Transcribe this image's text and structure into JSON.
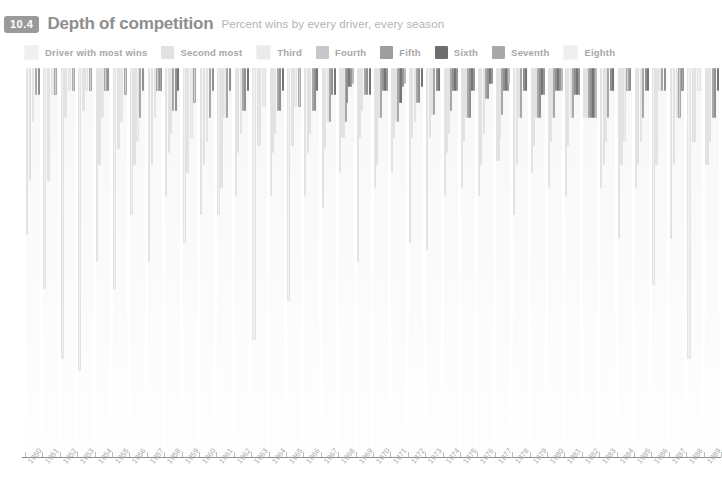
{
  "header": {
    "badge": "10.4",
    "title": "Depth of competition",
    "subtitle": "Percent wins by every driver, every season"
  },
  "legend": {
    "items": [
      {
        "label": "Driver with most wins",
        "color": "#f0f0f0"
      },
      {
        "label": "Second most",
        "color": "#e2e2e2"
      },
      {
        "label": "Third",
        "color": "#eaeaea"
      },
      {
        "label": "Fourth",
        "color": "#c8c8c8"
      },
      {
        "label": "Fifth",
        "color": "#9e9e9e"
      },
      {
        "label": "Sixth",
        "color": "#6e6e6e"
      },
      {
        "label": "Seventh",
        "color": "#a8a8a8"
      },
      {
        "label": "Eighth",
        "color": "#efefef"
      }
    ]
  },
  "chart_data": {
    "type": "bar",
    "title": "Depth of competition",
    "subtitle": "Percent wins by every driver, every season",
    "xlabel": "",
    "ylabel": "Percent wins",
    "ylim": [
      0,
      100
    ],
    "grid": false,
    "legend_position": "top",
    "orientation": "vertical",
    "note": "Each season column holds up to 8 nested bars, one per driver ranked by wins; bar length = that driver's percent of the season's wins.",
    "categories": [
      "1950",
      "1951",
      "1952",
      "1953",
      "1954",
      "1955",
      "1956",
      "1957",
      "1958",
      "1959",
      "1960",
      "1961",
      "1962",
      "1963",
      "1964",
      "1965",
      "1966",
      "1967",
      "1968",
      "1969",
      "1970",
      "1971",
      "1972",
      "1973",
      "1974",
      "1975",
      "1976",
      "1977",
      "1978",
      "1979",
      "1980",
      "1981",
      "1982",
      "1983",
      "1984",
      "1985",
      "1986",
      "1987",
      "1988",
      "1989"
    ],
    "series": [
      {
        "name": "Driver with most wins",
        "color": "#f0f0f0",
        "values": [
          43,
          57,
          75,
          78,
          50,
          57,
          38,
          50,
          33,
          45,
          38,
          38,
          33,
          70,
          33,
          60,
          33,
          36,
          27,
          50,
          31,
          27,
          45,
          47,
          33,
          31,
          33,
          24,
          38,
          27,
          31,
          33,
          13,
          31,
          44,
          31,
          56,
          44,
          75,
          25
        ]
      },
      {
        "name": "Second most",
        "color": "#e4e4e4",
        "values": [
          29,
          29,
          13,
          11,
          25,
          21,
          25,
          25,
          22,
          27,
          25,
          31,
          22,
          20,
          22,
          20,
          22,
          21,
          18,
          18,
          25,
          18,
          18,
          18,
          22,
          19,
          25,
          24,
          25,
          20,
          19,
          20,
          13,
          25,
          25,
          25,
          25,
          25,
          19,
          25
        ]
      },
      {
        "name": "Third",
        "color": "#ededed",
        "values": [
          14,
          7,
          6,
          6,
          13,
          14,
          19,
          13,
          17,
          18,
          19,
          13,
          17,
          10,
          17,
          10,
          17,
          14,
          18,
          11,
          13,
          14,
          14,
          12,
          17,
          13,
          17,
          18,
          13,
          13,
          13,
          13,
          13,
          19,
          19,
          19,
          6,
          13,
          6,
          19
        ]
      },
      {
        "name": "Fourth",
        "color": "#cfcfcf",
        "values": [
          7,
          7,
          6,
          6,
          6,
          7,
          13,
          6,
          11,
          9,
          13,
          13,
          11,
          0,
          11,
          10,
          11,
          14,
          14,
          7,
          13,
          14,
          9,
          12,
          11,
          13,
          8,
          12,
          13,
          13,
          13,
          13,
          13,
          13,
          6,
          13,
          6,
          13,
          0,
          13
        ]
      },
      {
        "name": "Fifth",
        "color": "#a6a6a6",
        "values": [
          7,
          0,
          0,
          0,
          6,
          0,
          6,
          6,
          11,
          0,
          6,
          6,
          11,
          0,
          11,
          0,
          11,
          7,
          9,
          7,
          6,
          9,
          9,
          6,
          6,
          13,
          8,
          6,
          6,
          13,
          6,
          7,
          13,
          6,
          6,
          6,
          6,
          6,
          0,
          13
        ]
      },
      {
        "name": "Sixth",
        "color": "#737373",
        "values": [
          0,
          0,
          0,
          0,
          0,
          0,
          0,
          0,
          6,
          0,
          0,
          0,
          6,
          0,
          6,
          0,
          6,
          7,
          5,
          7,
          6,
          9,
          5,
          6,
          6,
          6,
          4,
          6,
          6,
          7,
          6,
          7,
          13,
          6,
          0,
          6,
          0,
          0,
          0,
          6
        ]
      },
      {
        "name": "Seventh",
        "color": "#b0b0b0",
        "values": [
          0,
          0,
          0,
          0,
          0,
          0,
          0,
          0,
          0,
          0,
          0,
          0,
          0,
          0,
          0,
          0,
          0,
          0,
          5,
          0,
          6,
          5,
          0,
          0,
          6,
          6,
          4,
          6,
          0,
          7,
          6,
          7,
          13,
          0,
          0,
          0,
          0,
          0,
          0,
          0
        ]
      },
      {
        "name": "Eighth",
        "color": "#f2f2f2",
        "values": [
          0,
          0,
          0,
          0,
          0,
          0,
          0,
          0,
          0,
          0,
          0,
          0,
          0,
          0,
          0,
          0,
          0,
          0,
          4,
          0,
          0,
          4,
          0,
          0,
          0,
          0,
          0,
          4,
          0,
          0,
          6,
          0,
          13,
          0,
          0,
          0,
          0,
          0,
          0,
          0
        ]
      }
    ]
  }
}
